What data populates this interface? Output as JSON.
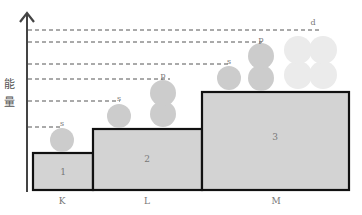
{
  "diagram": {
    "y_axis_label": [
      "能",
      "量"
    ],
    "levels": [
      {
        "name": "level-1",
        "y": 30
      },
      {
        "name": "level-2",
        "y": 42
      },
      {
        "name": "level-3",
        "y": 64
      },
      {
        "name": "level-4",
        "y": 79
      },
      {
        "name": "level-5",
        "y": 101
      },
      {
        "name": "level-6",
        "y": 127
      }
    ],
    "shells": [
      {
        "id": "K",
        "number": "1"
      },
      {
        "id": "L",
        "number": "2"
      },
      {
        "id": "M",
        "number": "3"
      }
    ],
    "orbitals": {
      "K_s": "s",
      "L_s": "s",
      "L_p": "p",
      "M_s": "s",
      "M_p": "p",
      "M_d": "d"
    },
    "colors": {
      "box_fill": "#d3d3d3",
      "orbital_fill": "#cccccc",
      "d_orbital_fill": "#ebebeb",
      "outline": "#111111"
    }
  }
}
